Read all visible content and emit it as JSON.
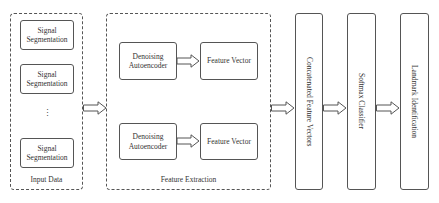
{
  "input_data": {
    "caption": "Input Data",
    "segments": [
      {
        "label": "Signal Segmentation"
      },
      {
        "label": "Signal Segmentation"
      },
      {
        "label": "Signal Segmentation"
      }
    ],
    "ellipsis": "⋮"
  },
  "feature_extraction": {
    "caption": "Feature Extraction",
    "branches": [
      {
        "encoder": "Denoising Autoencoder",
        "output": "Feature Vector"
      },
      {
        "encoder": "Denoising Autoencoder",
        "output": "Feature Vector"
      }
    ]
  },
  "pipeline": {
    "concatenated": "Concatenated Feature Vectors",
    "classifier": "Softmax Classifier",
    "output": "Landmark Identification"
  },
  "icons": {
    "arrow": "hollow-right-arrow"
  }
}
